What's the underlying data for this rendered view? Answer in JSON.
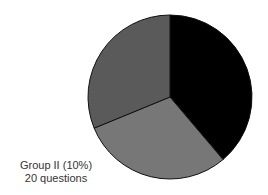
{
  "chart_data": {
    "type": "pie",
    "title": "",
    "slices": [
      {
        "name": "",
        "value": 38.8,
        "color": "#000000"
      },
      {
        "name": "",
        "value": 30.0,
        "color": "#777777"
      },
      {
        "name": "",
        "value": 31.2,
        "color": "#5a5a5a"
      }
    ],
    "annotations": [
      {
        "text": "Group II (10%)"
      },
      {
        "text": "20 questions"
      }
    ]
  },
  "label": {
    "line1": "Group II (10%)",
    "line2": "20 questions"
  }
}
